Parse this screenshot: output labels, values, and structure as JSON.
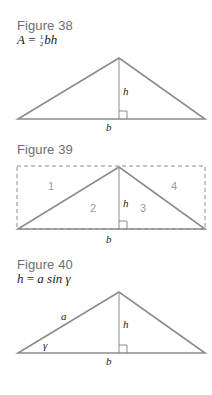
{
  "figures": [
    {
      "title": "Figure 38",
      "formula": {
        "lhs": "A",
        "eq": "=",
        "frac_num": "1",
        "frac_den": "2",
        "rhs": "bh"
      },
      "labels": {
        "height": "h",
        "base": "b"
      }
    },
    {
      "title": "Figure 39",
      "labels": {
        "height": "h",
        "base": "b"
      },
      "regions": [
        "1",
        "2",
        "3",
        "4"
      ]
    },
    {
      "title": "Figure 40",
      "formula": {
        "lhs": "h",
        "eq": "=",
        "rhs": "a sin γ"
      },
      "labels": {
        "height": "h",
        "base": "b",
        "side": "a",
        "angle": "γ"
      }
    }
  ],
  "colors": {
    "line": "#8c8c8c",
    "title": "#6e6e6e",
    "text": "#222222",
    "region_number": "#999999"
  }
}
